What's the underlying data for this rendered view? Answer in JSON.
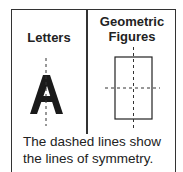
{
  "columns": [
    {
      "title": "Letters",
      "example": "A"
    },
    {
      "title_line1": "Geometric",
      "title_line2": "Figures",
      "example": "rectangle"
    }
  ],
  "caption": {
    "line1": "The dashed lines show",
    "line2": "the lines of symmetry."
  }
}
